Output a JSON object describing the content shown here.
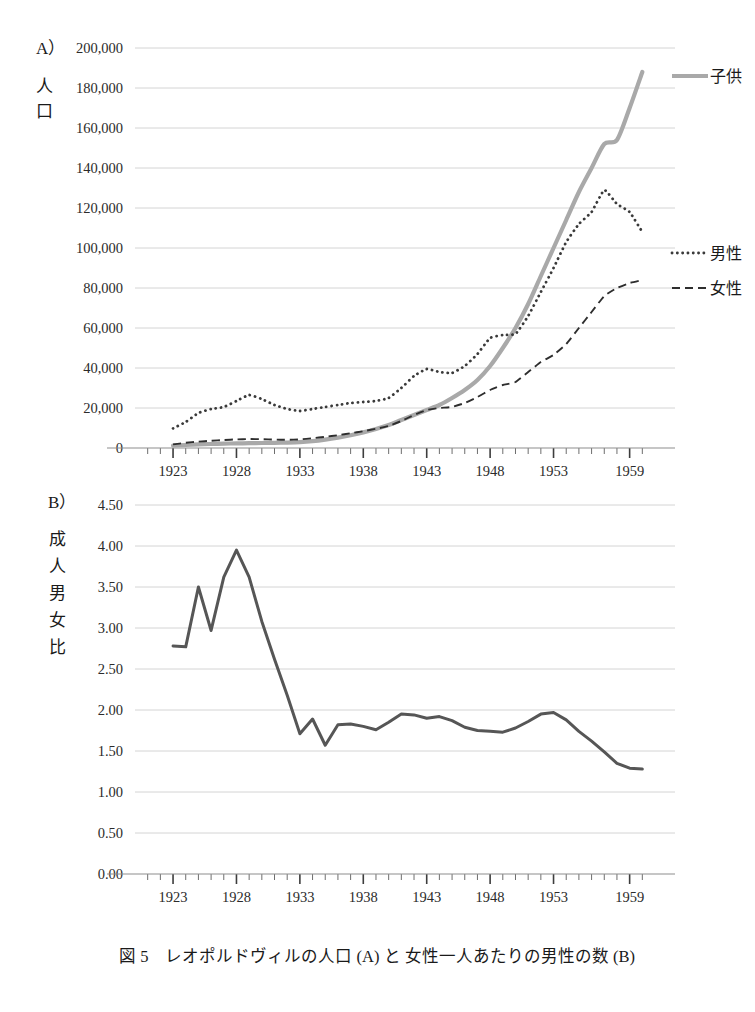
{
  "figure": {
    "caption": "図 5　レオポルドヴィルの人口 (A) と 女性一人あたりの男性の数 (B)",
    "caption_label": "図 5",
    "colors": {
      "children_line": "#a9a9a9",
      "men_line": "#3a3a3a",
      "women_line": "#2e2e2e",
      "ratio_line": "#565656",
      "gridline": "#c9c9c9",
      "axis": "#8d8d8d",
      "text": "#1a1a1a",
      "background": "#ffffff"
    }
  },
  "panel_a": {
    "letter": "A）",
    "y_axis_title": "人口",
    "y_axis_title_chars": [
      "人",
      "口"
    ],
    "legend": [
      {
        "label": "子供",
        "style": "solid",
        "color": "#a9a9a9"
      },
      {
        "label": "男性",
        "style": "dotted",
        "color": "#3a3a3a"
      },
      {
        "label": "女性",
        "style": "dashed",
        "color": "#2e2e2e"
      }
    ]
  },
  "panel_b": {
    "letter": "B）",
    "y_axis_title": "成人男女比",
    "y_axis_title_chars": [
      "成",
      "人",
      "男",
      "女",
      "比"
    ]
  },
  "chart_data": [
    {
      "type": "line",
      "panel": "A",
      "title": "レオポルドヴィルの人口",
      "xlabel": "",
      "ylabel": "人口",
      "xlim": [
        1920,
        1960
      ],
      "ylim": [
        0,
        200000
      ],
      "ytick_labels": [
        "0",
        "20,000",
        "40,000",
        "60,000",
        "80,000",
        "100,000",
        "120,000",
        "140,000",
        "160,000",
        "180,000",
        "200,000"
      ],
      "ytick_values": [
        0,
        20000,
        40000,
        60000,
        80000,
        100000,
        120000,
        140000,
        160000,
        180000,
        200000
      ],
      "xtick_labels": [
        "1923",
        "1928",
        "1933",
        "1938",
        "1943",
        "1948",
        "1953",
        "1959"
      ],
      "xtick_values": [
        1923,
        1928,
        1933,
        1938,
        1943,
        1948,
        1953,
        1959
      ],
      "grid": true,
      "legend_position": "right",
      "x": [
        1923,
        1924,
        1925,
        1926,
        1927,
        1928,
        1929,
        1930,
        1931,
        1932,
        1933,
        1934,
        1935,
        1936,
        1937,
        1938,
        1939,
        1940,
        1941,
        1942,
        1943,
        1944,
        1945,
        1946,
        1947,
        1948,
        1949,
        1950,
        1951,
        1952,
        1953,
        1954,
        1955,
        1956,
        1957,
        1958,
        1959,
        1960
      ],
      "series": [
        {
          "name": "子供",
          "style": "solid",
          "values": [
            1200,
            1500,
            1800,
            2000,
            2200,
            2300,
            2400,
            2500,
            2600,
            2700,
            2900,
            3400,
            4200,
            5200,
            6400,
            7800,
            9500,
            11500,
            14000,
            16500,
            19000,
            21500,
            25000,
            29000,
            34000,
            41000,
            50000,
            60000,
            72000,
            86000,
            100000,
            114000,
            128000,
            140000,
            152000,
            154000,
            170000,
            188000
          ]
        },
        {
          "name": "男性",
          "style": "dotted",
          "values": [
            9800,
            13000,
            17500,
            19500,
            20500,
            23500,
            26500,
            24500,
            21500,
            19500,
            18500,
            19500,
            20500,
            21500,
            22500,
            23000,
            23500,
            25000,
            30000,
            36000,
            39500,
            38000,
            37500,
            41000,
            47000,
            55000,
            56500,
            57000,
            66000,
            78000,
            90000,
            103000,
            112000,
            118000,
            129000,
            122000,
            118000,
            108000
          ]
        },
        {
          "name": "女性",
          "style": "dashed",
          "values": [
            1800,
            2600,
            3200,
            3600,
            4000,
            4300,
            4500,
            4400,
            4200,
            4100,
            4300,
            4900,
            5600,
            6400,
            7400,
            8400,
            9600,
            11000,
            13500,
            16500,
            19000,
            20000,
            20500,
            22500,
            25500,
            29000,
            31500,
            33000,
            38000,
            43000,
            46500,
            52000,
            60000,
            68000,
            76000,
            80000,
            82500,
            84000
          ]
        }
      ]
    },
    {
      "type": "line",
      "panel": "B",
      "title": "女性一人あたりの男性の数",
      "xlabel": "",
      "ylabel": "成人男女比",
      "xlim": [
        1920,
        1960
      ],
      "ylim": [
        0.0,
        4.5
      ],
      "ytick_labels": [
        "0.00",
        "0.50",
        "1.00",
        "1.50",
        "2.00",
        "2.50",
        "3.00",
        "3.50",
        "4.00",
        "4.50"
      ],
      "ytick_values": [
        0.0,
        0.5,
        1.0,
        1.5,
        2.0,
        2.5,
        3.0,
        3.5,
        4.0,
        4.5
      ],
      "xtick_labels": [
        "1923",
        "1928",
        "1933",
        "1938",
        "1943",
        "1948",
        "1953",
        "1959"
      ],
      "xtick_values": [
        1923,
        1928,
        1933,
        1938,
        1943,
        1948,
        1953,
        1959
      ],
      "grid": true,
      "legend_position": "none",
      "x": [
        1923,
        1924,
        1925,
        1926,
        1927,
        1928,
        1929,
        1930,
        1931,
        1932,
        1933,
        1934,
        1935,
        1936,
        1937,
        1938,
        1939,
        1940,
        1941,
        1942,
        1943,
        1944,
        1945,
        1946,
        1947,
        1948,
        1949,
        1950,
        1951,
        1952,
        1953,
        1954,
        1955,
        1956,
        1957,
        1958,
        1959,
        1960
      ],
      "series": [
        {
          "name": "成人男女比",
          "style": "solid",
          "values": [
            2.78,
            2.77,
            3.5,
            2.97,
            3.62,
            3.95,
            3.62,
            3.08,
            2.62,
            2.18,
            1.71,
            1.89,
            1.57,
            1.82,
            1.83,
            1.8,
            1.76,
            1.85,
            1.95,
            1.94,
            1.9,
            1.92,
            1.87,
            1.79,
            1.75,
            1.74,
            1.73,
            1.78,
            1.86,
            1.95,
            1.97,
            1.88,
            1.74,
            1.62,
            1.49,
            1.35,
            1.29,
            1.28
          ]
        }
      ]
    }
  ]
}
